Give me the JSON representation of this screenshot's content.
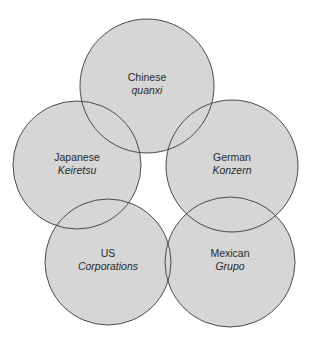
{
  "diagram": {
    "type": "overlapping-circles",
    "fill_color": "#d6d6d6",
    "stroke_color": "#4a4a4a",
    "background": "#ffffff",
    "nodes": [
      {
        "id": "chinese",
        "country": "Chinese",
        "term": "quanxi",
        "cx": 147,
        "cy": 86,
        "r": 67
      },
      {
        "id": "japanese",
        "country": "Japanese",
        "term": "Keiretsu",
        "cx": 77,
        "cy": 165,
        "r": 64
      },
      {
        "id": "german",
        "country": "German",
        "term": "Konzern",
        "cx": 232,
        "cy": 166,
        "r": 66
      },
      {
        "id": "us",
        "country": "US",
        "term": "Corporations",
        "cx": 108,
        "cy": 262,
        "r": 63
      },
      {
        "id": "mexican",
        "country": "Mexican",
        "term": "Grupo",
        "cx": 230,
        "cy": 262,
        "r": 65
      }
    ]
  }
}
